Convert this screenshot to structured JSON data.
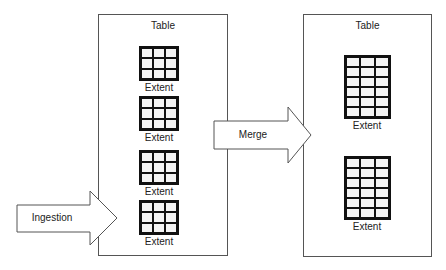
{
  "diagram": {
    "left_table": {
      "title": "Table",
      "extents": [
        {
          "label": "Extent",
          "rows": 3,
          "cols": 3
        },
        {
          "label": "Extent",
          "rows": 3,
          "cols": 3
        },
        {
          "label": "Extent",
          "rows": 3,
          "cols": 3
        },
        {
          "label": "Extent",
          "rows": 3,
          "cols": 3
        }
      ]
    },
    "right_table": {
      "title": "Table",
      "extents": [
        {
          "label": "Extent",
          "rows": 6,
          "cols": 3
        },
        {
          "label": "Extent",
          "rows": 6,
          "cols": 3
        }
      ]
    },
    "arrows": {
      "ingestion": "Ingestion",
      "merge": "Merge"
    },
    "colors": {
      "border": "#555555",
      "grid": "#111111",
      "cell": "#f4f4f4",
      "background": "#ffffff"
    }
  }
}
